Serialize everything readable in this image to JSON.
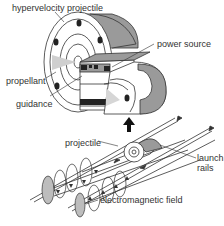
{
  "diagram": {
    "labels": {
      "hypervelocity_projectile": "hypervelocity projectile",
      "power_source": "power source",
      "propellant": "propellant",
      "guidance": "guidance",
      "projectile": "projectile",
      "launch_rails_line1": "launch",
      "launch_rails_line2": "rails",
      "electromagnetic_field": "electromagnetic field"
    },
    "colors": {
      "line": "#333333",
      "shade": "#9a9a9a",
      "light_shade": "#c8c8c8",
      "dark": "#222222",
      "background": "#ffffff"
    }
  }
}
